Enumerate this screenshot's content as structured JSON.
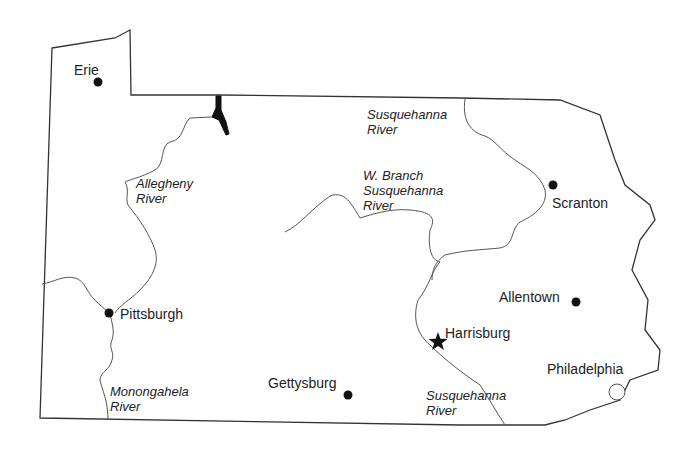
{
  "map": {
    "title": "Pennsylvania",
    "colors": {
      "outline": "#333333",
      "river": "#555555",
      "marker": "#111111",
      "background": "#ffffff"
    },
    "cities": [
      {
        "name": "Erie",
        "marker": "dot"
      },
      {
        "name": "Pittsburgh",
        "marker": "dot"
      },
      {
        "name": "Scranton",
        "marker": "dot"
      },
      {
        "name": "Allentown",
        "marker": "dot"
      },
      {
        "name": "Harrisburg",
        "marker": "star"
      },
      {
        "name": "Gettysburg",
        "marker": "dot"
      },
      {
        "name": "Philadelphia",
        "marker": "open-circle"
      }
    ],
    "rivers": [
      {
        "line1": "Susquehanna",
        "line2": "River"
      },
      {
        "line1": "W. Branch",
        "line2": "Susquehanna",
        "line3": "River"
      },
      {
        "line1": "Allegheny",
        "line2": "River"
      },
      {
        "line1": "Monongahela",
        "line2": "River"
      },
      {
        "line1": "Susquehanna",
        "line2": "River"
      }
    ]
  }
}
